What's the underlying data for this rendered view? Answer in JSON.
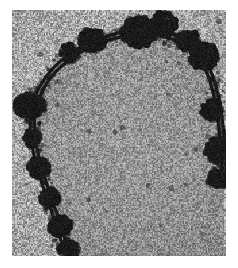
{
  "image": {
    "kind": "transmission-electron-micrograph",
    "title": "Electron micrograph of an arched membrane profile",
    "width_px": 238,
    "height_px": 268,
    "border_color": "#ffffff",
    "border_left_px": 12,
    "border_top_px": 10,
    "content_width_px": 214,
    "content_height_px": 246
  },
  "render": {
    "background_mean_gray": 166,
    "background_noise_amplitude": 62,
    "interior_mean_gray": 150,
    "interior_noise_amplitude": 54,
    "exterior_mean_gray": 176,
    "exterior_noise_amplitude": 66,
    "structure_color": "#0d0d0d",
    "grain_cell_px": 1.35,
    "seed": 20250714
  },
  "structure": {
    "name": "arched-membrane-filament",
    "description": "Dark arch-shaped double-track membrane running from lower-left, up around the top, and down the right side",
    "stroke_width_px": 7.5,
    "inner_gap_px": 1.6,
    "path_points": [
      [
        56,
        246
      ],
      [
        52,
        232
      ],
      [
        46,
        214
      ],
      [
        40,
        196
      ],
      [
        33,
        176
      ],
      [
        27,
        156
      ],
      [
        22,
        136
      ],
      [
        20,
        118
      ],
      [
        21,
        100
      ],
      [
        26,
        84
      ],
      [
        35,
        68
      ],
      [
        48,
        54
      ],
      [
        64,
        42
      ],
      [
        82,
        33
      ],
      [
        102,
        26
      ],
      [
        122,
        22
      ],
      [
        142,
        22
      ],
      [
        160,
        26
      ],
      [
        175,
        34
      ],
      [
        187,
        45
      ],
      [
        196,
        59
      ],
      [
        202,
        76
      ],
      [
        206,
        95
      ],
      [
        209,
        116
      ],
      [
        211,
        138
      ],
      [
        212,
        158
      ],
      [
        212,
        175
      ]
    ]
  },
  "aggregates": [
    {
      "name": "clump-top-center-large",
      "cx": 127,
      "cy": 22,
      "rx": 17,
      "ry": 15,
      "density": 0.92
    },
    {
      "name": "clump-top-right-peak",
      "cx": 152,
      "cy": 14,
      "rx": 13,
      "ry": 12,
      "density": 0.88
    },
    {
      "name": "clump-upper-left-edge",
      "cx": 80,
      "cy": 30,
      "rx": 13,
      "ry": 11,
      "density": 0.84
    },
    {
      "name": "clump-upper-left-node",
      "cx": 57,
      "cy": 43,
      "rx": 9,
      "ry": 9,
      "density": 0.78
    },
    {
      "name": "clump-right-shoulder",
      "cx": 176,
      "cy": 30,
      "rx": 11,
      "ry": 10,
      "density": 0.82
    },
    {
      "name": "clump-right-outer",
      "cx": 192,
      "cy": 46,
      "rx": 14,
      "ry": 13,
      "density": 0.9
    },
    {
      "name": "clump-right-mid",
      "cx": 200,
      "cy": 100,
      "rx": 11,
      "ry": 10,
      "density": 0.8
    },
    {
      "name": "clump-right-lower",
      "cx": 205,
      "cy": 140,
      "rx": 12,
      "ry": 12,
      "density": 0.84
    },
    {
      "name": "clump-right-foot",
      "cx": 205,
      "cy": 168,
      "rx": 9,
      "ry": 10,
      "density": 0.72
    },
    {
      "name": "clump-left-protrusion",
      "cx": 18,
      "cy": 96,
      "rx": 15,
      "ry": 12,
      "density": 0.88
    },
    {
      "name": "clump-left-mid",
      "cx": 21,
      "cy": 128,
      "rx": 9,
      "ry": 9,
      "density": 0.74
    },
    {
      "name": "clump-left-lower",
      "cx": 27,
      "cy": 158,
      "rx": 11,
      "ry": 10,
      "density": 0.8
    },
    {
      "name": "clump-left-foot",
      "cx": 38,
      "cy": 188,
      "rx": 10,
      "ry": 9,
      "density": 0.78
    },
    {
      "name": "clump-bottom-left",
      "cx": 48,
      "cy": 216,
      "rx": 11,
      "ry": 10,
      "density": 0.82
    },
    {
      "name": "clump-bottom-edge",
      "cx": 57,
      "cy": 240,
      "rx": 10,
      "ry": 10,
      "density": 0.8
    }
  ],
  "speckles": {
    "name": "interior-dark-speckles",
    "count": 34,
    "radius_px": [
      1,
      3
    ]
  }
}
